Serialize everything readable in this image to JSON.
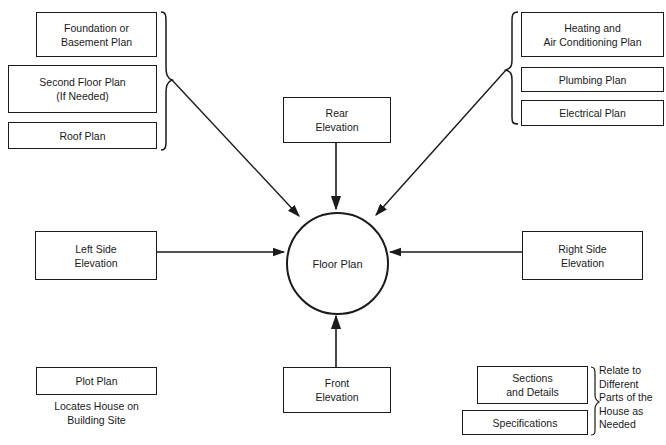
{
  "diagram": {
    "center": {
      "label": "Floor Plan"
    },
    "top_left_group": {
      "items": [
        {
          "line1": "Foundation or",
          "line2": "Basement Plan"
        },
        {
          "line1": "Second Floor Plan",
          "line2": "(If Needed)"
        },
        {
          "line1": "Roof Plan",
          "line2": ""
        }
      ]
    },
    "top_right_group": {
      "items": [
        {
          "line1": "Heating and",
          "line2": "Air Conditioning Plan"
        },
        {
          "line1": "Plumbing Plan",
          "line2": ""
        },
        {
          "line1": "Electrical Plan",
          "line2": ""
        }
      ]
    },
    "rear": {
      "line1": "Rear",
      "line2": "Elevation"
    },
    "left_side": {
      "line1": "Left Side",
      "line2": "Elevation"
    },
    "right_side": {
      "line1": "Right Side",
      "line2": "Elevation"
    },
    "front": {
      "line1": "Front",
      "line2": "Elevation"
    },
    "plot_plan": {
      "label": "Plot Plan",
      "note_line1": "Locates House on",
      "note_line2": "Building Site"
    },
    "bottom_right_group": {
      "items": [
        {
          "line1": "Sections",
          "line2": "and Details"
        },
        {
          "line1": "Specifications",
          "line2": ""
        }
      ],
      "note": [
        "Relate to",
        "Different",
        "Parts of the",
        "House as",
        "Needed"
      ]
    },
    "connections": [
      {
        "from": "top_left_group",
        "to": "center"
      },
      {
        "from": "top_right_group",
        "to": "center"
      },
      {
        "from": "rear",
        "to": "center"
      },
      {
        "from": "left_side",
        "to": "center"
      },
      {
        "from": "right_side",
        "to": "center"
      },
      {
        "from": "front",
        "to": "center"
      }
    ]
  }
}
